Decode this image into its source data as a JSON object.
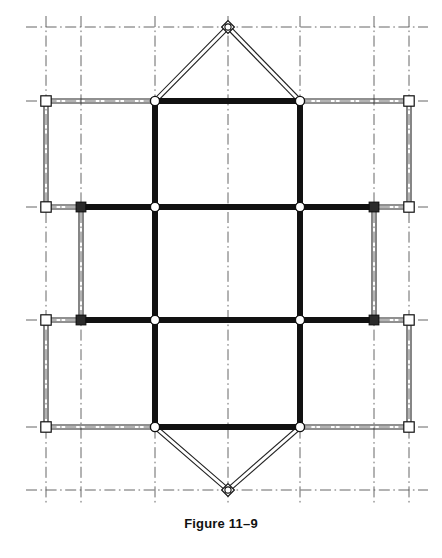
{
  "figure": {
    "caption": "Figure 11–9",
    "domain_kind": "structural-framing-diagram",
    "background_color": "#ffffff",
    "ink_color": "#111111",
    "gridline_color": "#555555",
    "heavy_member_color": "#111111",
    "light_member_color": "#222222",
    "canvas": {
      "width": 442,
      "height": 558
    }
  },
  "grid": {
    "style": "dash-dot centerlines",
    "x_lines": [
      46,
      81,
      155,
      228,
      300,
      374,
      409
    ],
    "y_lines": [
      27,
      101,
      207,
      320,
      427,
      490
    ],
    "x_extent": [
      26,
      428
    ],
    "y_extent": [
      16,
      505
    ]
  },
  "geometry": {
    "heavy_width": 6,
    "light_width": 1.1,
    "light_gap": 4,
    "columns_x": [
      155,
      300
    ],
    "levels_y": [
      101,
      207,
      320,
      427
    ],
    "outer_left_x": 46,
    "outer_right_x": 409,
    "inner_left_x": 81,
    "inner_right_x": 374,
    "apex_top": {
      "x": 228,
      "y": 27
    },
    "apex_bottom": {
      "x": 228,
      "y": 490
    }
  },
  "members": {
    "heavy_beams": [
      {
        "name": "roof-beam",
        "x1": 155,
        "y1": 101,
        "x2": 300,
        "y2": 101
      },
      {
        "name": "level-2-beam",
        "x1": 81,
        "y1": 207,
        "x2": 374,
        "y2": 207
      },
      {
        "name": "level-3-beam",
        "x1": 81,
        "y1": 320,
        "x2": 374,
        "y2": 320
      },
      {
        "name": "base-beam",
        "x1": 155,
        "y1": 427,
        "x2": 300,
        "y2": 427
      }
    ],
    "heavy_columns": [
      {
        "name": "left-column",
        "x1": 155,
        "y1": 101,
        "x2": 155,
        "y2": 427
      },
      {
        "name": "right-column",
        "x1": 300,
        "y1": 101,
        "x2": 300,
        "y2": 427
      }
    ],
    "light_beams": [
      {
        "name": "top-left-outrigger",
        "x1": 46,
        "y1": 101,
        "x2": 155,
        "y2": 101
      },
      {
        "name": "top-right-outrigger",
        "x1": 300,
        "y1": 101,
        "x2": 409,
        "y2": 101
      },
      {
        "name": "level-2-left-stub",
        "x1": 46,
        "y1": 207,
        "x2": 81,
        "y2": 207
      },
      {
        "name": "level-2-right-stub",
        "x1": 374,
        "y1": 207,
        "x2": 409,
        "y2": 207
      },
      {
        "name": "level-3-left-stub",
        "x1": 46,
        "y1": 320,
        "x2": 81,
        "y2": 320
      },
      {
        "name": "level-3-right-stub",
        "x1": 374,
        "y1": 320,
        "x2": 409,
        "y2": 320
      },
      {
        "name": "base-left-outrigger",
        "x1": 46,
        "y1": 427,
        "x2": 155,
        "y2": 427
      },
      {
        "name": "base-right-outrigger",
        "x1": 300,
        "y1": 427,
        "x2": 409,
        "y2": 427
      }
    ],
    "light_columns": [
      {
        "name": "outer-left-upper-post",
        "x1": 46,
        "y1": 101,
        "x2": 46,
        "y2": 207
      },
      {
        "name": "outer-right-upper-post",
        "x1": 409,
        "y1": 101,
        "x2": 409,
        "y2": 207
      },
      {
        "name": "outer-left-lower-post",
        "x1": 46,
        "y1": 320,
        "x2": 46,
        "y2": 427
      },
      {
        "name": "outer-right-lower-post",
        "x1": 409,
        "y1": 320,
        "x2": 409,
        "y2": 427
      },
      {
        "name": "inner-left-mid-post",
        "x1": 81,
        "y1": 207,
        "x2": 81,
        "y2": 320
      },
      {
        "name": "inner-right-mid-post",
        "x1": 374,
        "y1": 207,
        "x2": 374,
        "y2": 320
      }
    ],
    "light_braces": [
      {
        "name": "roof-brace-left",
        "x1": 155,
        "y1": 101,
        "x2": 228,
        "y2": 27
      },
      {
        "name": "roof-brace-right",
        "x1": 300,
        "y1": 101,
        "x2": 228,
        "y2": 27
      },
      {
        "name": "base-brace-left",
        "x1": 155,
        "y1": 427,
        "x2": 228,
        "y2": 490
      },
      {
        "name": "base-brace-right",
        "x1": 300,
        "y1": 427,
        "x2": 228,
        "y2": 490
      }
    ]
  },
  "joints": {
    "circle": [
      {
        "name": "joint-roof-left",
        "x": 155,
        "y": 101
      },
      {
        "name": "joint-roof-right",
        "x": 300,
        "y": 101
      },
      {
        "name": "joint-level2-left",
        "x": 155,
        "y": 207
      },
      {
        "name": "joint-level2-right",
        "x": 300,
        "y": 207
      },
      {
        "name": "joint-level3-left",
        "x": 155,
        "y": 320
      },
      {
        "name": "joint-level3-right",
        "x": 300,
        "y": 320
      },
      {
        "name": "joint-base-left",
        "x": 155,
        "y": 427
      },
      {
        "name": "joint-base-right",
        "x": 300,
        "y": 427
      }
    ],
    "filled_square": [
      {
        "name": "joint-level2-inner-left",
        "x": 81,
        "y": 207
      },
      {
        "name": "joint-level2-inner-right",
        "x": 374,
        "y": 207
      },
      {
        "name": "joint-level3-inner-left",
        "x": 81,
        "y": 320
      },
      {
        "name": "joint-level3-inner-right",
        "x": 374,
        "y": 320
      }
    ],
    "open_square": [
      {
        "name": "support-outer-top-left",
        "x": 46,
        "y": 101
      },
      {
        "name": "support-outer-top-right",
        "x": 409,
        "y": 101
      },
      {
        "name": "support-outer-mid-upper-left",
        "x": 46,
        "y": 207
      },
      {
        "name": "support-outer-mid-upper-right",
        "x": 409,
        "y": 207
      },
      {
        "name": "support-outer-mid-lower-left",
        "x": 46,
        "y": 320
      },
      {
        "name": "support-outer-mid-lower-right",
        "x": 409,
        "y": 320
      },
      {
        "name": "support-outer-bottom-left",
        "x": 46,
        "y": 427
      },
      {
        "name": "support-outer-bottom-right",
        "x": 409,
        "y": 427
      }
    ],
    "diamond": [
      {
        "name": "apex-joint-top",
        "x": 228,
        "y": 27
      },
      {
        "name": "apex-joint-bottom",
        "x": 228,
        "y": 490
      }
    ]
  }
}
